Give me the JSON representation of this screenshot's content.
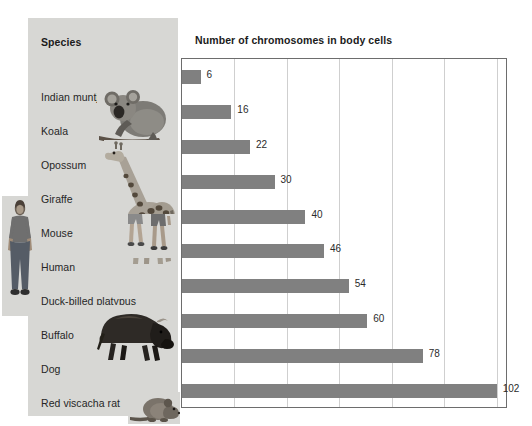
{
  "chart_data": {
    "type": "bar",
    "orientation": "horizontal",
    "title": "Number of chromosomes in body cells",
    "category_header": "Species",
    "categories": [
      "Indian muntjac deer",
      "Koala",
      "Opossum",
      "Giraffe",
      "Mouse",
      "Human",
      "Duck-billed platypus",
      "Buffalo",
      "Dog",
      "Red viscacha rat"
    ],
    "values": [
      6,
      16,
      22,
      30,
      40,
      46,
      54,
      60,
      78,
      102
    ],
    "value_labels": [
      "6",
      "16",
      "22",
      "30",
      "40",
      "46",
      "54",
      "60",
      "78",
      "102"
    ],
    "xlabel": "",
    "ylabel": "",
    "xlim": [
      0,
      105
    ],
    "grid": true,
    "gridline_values": [
      17,
      34,
      51,
      68,
      85,
      102
    ],
    "legend": "none",
    "bar_color": "#808080",
    "panel_color": "#d7d7d4",
    "plot_border_color": "#6d6d6d",
    "gridline_color": "#cfcfcf"
  },
  "panel": {
    "header": "Species",
    "items": [
      {
        "label": "Indian muntjac deer"
      },
      {
        "label": "Koala"
      },
      {
        "label": "Opossum"
      },
      {
        "label": "Giraffe"
      },
      {
        "label": "Mouse"
      },
      {
        "label": "Human"
      },
      {
        "label": "Duck-billed platypus"
      },
      {
        "label": "Buffalo"
      },
      {
        "label": "Dog"
      },
      {
        "label": "Red viscacha rat"
      }
    ]
  },
  "chart": {
    "title": "Number of chromosomes in body cells"
  },
  "photos": [
    {
      "name": "human-standing-photo"
    },
    {
      "name": "koala-photo"
    },
    {
      "name": "giraffe-photo"
    },
    {
      "name": "humans-legs-photo"
    },
    {
      "name": "buffalo-photo"
    },
    {
      "name": "rat-photo"
    }
  ]
}
